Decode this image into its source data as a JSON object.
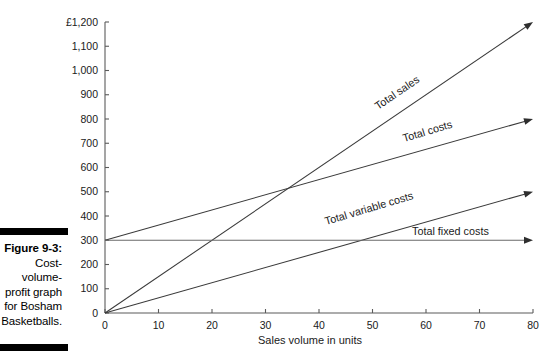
{
  "figure": {
    "label": "Figure 9-3:",
    "caption": "Cost-\nvolume-\nprofit graph\nfor Bosham\nBasketballs."
  },
  "chart_data": {
    "type": "line",
    "title": "",
    "xlabel": "Sales volume in units",
    "ylabel": "",
    "xlim": [
      0,
      80
    ],
    "ylim": [
      0,
      1200
    ],
    "grid": false,
    "legend_position": "inline-labels",
    "currency_symbol": "£",
    "x_ticks": [
      "0",
      "10",
      "20",
      "30",
      "40",
      "50",
      "60",
      "70",
      "80"
    ],
    "x_tick_values": [
      0,
      10,
      20,
      30,
      40,
      50,
      60,
      70,
      80
    ],
    "y_ticks": [
      "0",
      "100",
      "200",
      "300",
      "400",
      "500",
      "600",
      "700",
      "800",
      "900",
      "1,000",
      "1,100",
      "£1,200"
    ],
    "y_tick_values": [
      0,
      100,
      200,
      300,
      400,
      500,
      600,
      700,
      800,
      900,
      1000,
      1100,
      1200
    ],
    "series": [
      {
        "name": "Total sales",
        "label": "Total sales",
        "color": "#3a3a3a",
        "arrow": true,
        "x": [
          0,
          80
        ],
        "values": [
          0,
          1200
        ]
      },
      {
        "name": "Total costs",
        "label": "Total costs",
        "color": "#3a3a3a",
        "arrow": true,
        "x": [
          0,
          80
        ],
        "values": [
          300,
          800
        ]
      },
      {
        "name": "Total variable costs",
        "label": "Total variable costs",
        "color": "#3a3a3a",
        "arrow": true,
        "x": [
          0,
          80
        ],
        "values": [
          0,
          500
        ]
      },
      {
        "name": "Total fixed costs",
        "label": "Total fixed costs",
        "color": "#6a6a6a",
        "arrow": true,
        "x": [
          0,
          80
        ],
        "values": [
          300,
          300
        ]
      }
    ],
    "annotations": [
      {
        "name": "break-even-point",
        "x": 35,
        "y": 500,
        "text": ""
      }
    ]
  }
}
